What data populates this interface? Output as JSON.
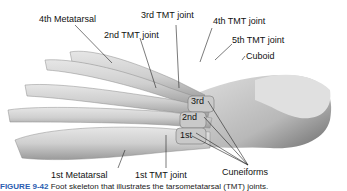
{
  "figure": {
    "caption_label": "FIGURE 9-42",
    "caption_text": "Foot skeleton that illustrates the tarsometatarsal (TMT) joints.",
    "labels": {
      "metatarsal_4": "4th Metatarsal",
      "tmt_3": "3rd TMT joint",
      "tmt_4": "4th TMT joint",
      "tmt_2": "2nd TMT joint",
      "tmt_5": "5th TMT joint",
      "cuboid": "Cuboid",
      "cuneiform_3": "3rd",
      "cuneiform_2": "2nd",
      "cuneiform_1": "1st",
      "metatarsal_1": "1st Metatarsal",
      "tmt_1": "1st TMT joint",
      "cuneiforms": "Cuneiforms"
    }
  }
}
